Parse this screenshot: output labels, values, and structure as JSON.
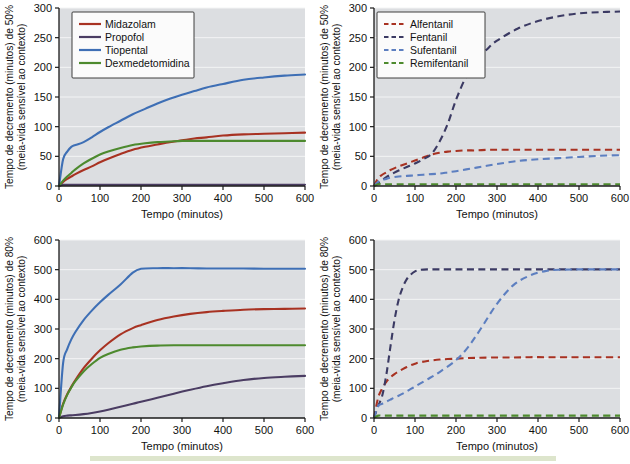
{
  "figure": {
    "background_color": "#ffffff",
    "plot_background_color": "#dcdee1",
    "gridline_color": "#f3f4f5",
    "accent_bar_color": "#dde5cc"
  },
  "common": {
    "xlabel": "Tempo (minutos)",
    "ylabel_line2": "(meia-vida sensível ao contexto)",
    "x_ticks": [
      "0",
      "100",
      "200",
      "300",
      "400",
      "500",
      "600"
    ]
  },
  "chart_data": [
    {
      "id": "panel-top-left",
      "type": "line",
      "title": "",
      "xlabel": "Tempo (minutos)",
      "ylabel": "Tempo de decremento (minutos) de 50%",
      "ylabel_sub": "(meia-vida sensível ao contexto)",
      "xlim": [
        0,
        600
      ],
      "ylim": [
        0,
        300
      ],
      "x_ticks": [
        0,
        100,
        200,
        300,
        400,
        500,
        600
      ],
      "y_ticks": [
        0,
        50,
        100,
        150,
        200,
        250,
        300
      ],
      "grid": true,
      "legend_position": "top-left",
      "line_style": "solid",
      "x": [
        0,
        10,
        20,
        30,
        40,
        60,
        80,
        100,
        120,
        150,
        180,
        210,
        240,
        270,
        300,
        330,
        360,
        400,
        450,
        500,
        550,
        600
      ],
      "series": [
        {
          "name": "Midazolam",
          "color": "#a83222",
          "values": [
            0,
            7,
            12,
            16,
            20,
            27,
            33,
            40,
            46,
            54,
            61,
            66,
            70,
            74,
            77,
            80,
            82,
            85,
            87,
            88,
            89,
            90
          ]
        },
        {
          "name": "Propofol",
          "color": "#4b3d63",
          "values": [
            0,
            2,
            2,
            2,
            2,
            2,
            2,
            2,
            2,
            2,
            2,
            2,
            2,
            2,
            2,
            2,
            2,
            2,
            2,
            2,
            2,
            2
          ]
        },
        {
          "name": "Tiopental",
          "color": "#3e6fb5",
          "values": [
            0,
            45,
            58,
            66,
            69,
            74,
            82,
            91,
            99,
            110,
            121,
            130,
            139,
            147,
            154,
            160,
            166,
            172,
            179,
            183,
            186,
            188
          ]
        },
        {
          "name": "Dexmedetomidina",
          "color": "#4d8a2e",
          "values": [
            0,
            9,
            16,
            22,
            28,
            38,
            46,
            53,
            58,
            64,
            69,
            72,
            74,
            75,
            76,
            76,
            76,
            76,
            76,
            76,
            76,
            76
          ]
        }
      ]
    },
    {
      "id": "panel-top-right",
      "type": "line",
      "title": "",
      "xlabel": "Tempo (minutos)",
      "ylabel": "Tempo de decremento (minutos) de 50%",
      "ylabel_sub": "(meia-vida sensível ao contexto)",
      "xlim": [
        0,
        600
      ],
      "ylim": [
        0,
        300
      ],
      "x_ticks": [
        0,
        100,
        200,
        300,
        400,
        500,
        600
      ],
      "y_ticks": [
        0,
        50,
        100,
        150,
        200,
        250,
        300
      ],
      "grid": true,
      "legend_position": "top-left",
      "line_style": "dashed",
      "x": [
        0,
        10,
        20,
        30,
        40,
        60,
        80,
        100,
        120,
        140,
        160,
        180,
        200,
        225,
        250,
        275,
        300,
        350,
        400,
        450,
        500,
        550,
        600
      ],
      "series": [
        {
          "name": "Alfentanil",
          "color": "#a83222",
          "values": [
            0,
            13,
            19,
            23,
            27,
            33,
            38,
            43,
            48,
            53,
            56,
            58,
            59,
            60,
            60,
            61,
            61,
            61,
            61,
            61,
            61,
            61,
            61
          ]
        },
        {
          "name": "Fentanil",
          "color": "#3b3a63",
          "values": [
            0,
            5,
            10,
            15,
            19,
            26,
            32,
            38,
            45,
            54,
            75,
            105,
            145,
            185,
            212,
            230,
            245,
            265,
            278,
            286,
            291,
            293,
            294
          ]
        },
        {
          "name": "Sufentanil",
          "color": "#5d7fc0",
          "values": [
            0,
            7,
            10,
            12,
            14,
            16,
            17,
            18,
            19,
            20,
            21,
            23,
            25,
            28,
            31,
            34,
            37,
            42,
            45,
            47,
            49,
            51,
            52
          ]
        },
        {
          "name": "Remifentanil",
          "color": "#4d8a2e",
          "values": [
            0,
            3,
            3,
            3,
            3,
            3,
            3,
            3,
            3,
            3,
            3,
            3,
            3,
            3,
            3,
            3,
            3,
            3,
            3,
            3,
            3,
            3,
            3
          ]
        }
      ]
    },
    {
      "id": "panel-bottom-left",
      "type": "line",
      "title": "",
      "xlabel": "Tempo (minutos)",
      "ylabel": "Tempo de decremento (minutos) de 80%",
      "ylabel_sub": "(meia-vida sensível ao contexto)",
      "xlim": [
        0,
        600
      ],
      "ylim": [
        0,
        600
      ],
      "x_ticks": [
        0,
        100,
        200,
        300,
        400,
        500,
        600
      ],
      "y_ticks": [
        0,
        100,
        200,
        300,
        400,
        500,
        600
      ],
      "grid": true,
      "legend_position": "none",
      "line_style": "solid",
      "x": [
        0,
        10,
        20,
        30,
        40,
        60,
        80,
        100,
        120,
        150,
        180,
        200,
        240,
        280,
        320,
        360,
        400,
        450,
        500,
        550,
        600
      ],
      "series": [
        {
          "name": "Midazolam",
          "color": "#a83222",
          "values": [
            0,
            48,
            80,
            105,
            128,
            168,
            200,
            228,
            252,
            282,
            303,
            313,
            330,
            342,
            351,
            357,
            361,
            365,
            367,
            368,
            369
          ]
        },
        {
          "name": "Propofol",
          "color": "#4b3d63",
          "values": [
            0,
            6,
            8,
            9,
            10,
            13,
            17,
            22,
            28,
            38,
            48,
            55,
            68,
            82,
            95,
            107,
            117,
            128,
            135,
            139,
            142
          ]
        },
        {
          "name": "Tiopental",
          "color": "#3e6fb5",
          "values": [
            0,
            185,
            232,
            265,
            290,
            330,
            362,
            390,
            415,
            450,
            490,
            503,
            505,
            505,
            505,
            504,
            504,
            504,
            503,
            503,
            503
          ]
        },
        {
          "name": "Dexmedetomidina",
          "color": "#4d8a2e",
          "values": [
            0,
            45,
            78,
            103,
            124,
            157,
            182,
            203,
            216,
            230,
            238,
            241,
            244,
            245,
            245,
            245,
            245,
            245,
            245,
            245,
            245
          ]
        }
      ]
    },
    {
      "id": "panel-bottom-right",
      "type": "line",
      "title": "",
      "xlabel": "Tempo (minutos)",
      "ylabel": "Tempo de decremento (minutos) de 80%",
      "ylabel_sub": "(meia-vida sensível ao contexto)",
      "xlim": [
        0,
        600
      ],
      "ylim": [
        0,
        600
      ],
      "x_ticks": [
        0,
        100,
        200,
        300,
        400,
        500,
        600
      ],
      "y_ticks": [
        0,
        100,
        200,
        300,
        400,
        500,
        600
      ],
      "grid": true,
      "legend_position": "none",
      "line_style": "dashed",
      "x": [
        0,
        10,
        20,
        30,
        40,
        50,
        60,
        70,
        80,
        90,
        100,
        110,
        130,
        160,
        200,
        230,
        260,
        300,
        340,
        380,
        420,
        460,
        500,
        550,
        600
      ],
      "series": [
        {
          "name": "Alfentanil",
          "color": "#a83222",
          "values": [
            0,
            68,
            100,
            122,
            137,
            148,
            157,
            165,
            172,
            178,
            183,
            187,
            192,
            197,
            200,
            202,
            203,
            204,
            204,
            205,
            205,
            205,
            205,
            205,
            205
          ]
        },
        {
          "name": "Fentanil",
          "color": "#3b3a63",
          "values": [
            0,
            40,
            75,
            145,
            240,
            330,
            398,
            440,
            468,
            484,
            494,
            499,
            501,
            501,
            501,
            501,
            501,
            501,
            501,
            501,
            501,
            501,
            501,
            501,
            501
          ]
        },
        {
          "name": "Sufentanil",
          "color": "#5d7fc0",
          "values": [
            0,
            40,
            48,
            55,
            62,
            69,
            75,
            82,
            90,
            98,
            106,
            114,
            130,
            155,
            195,
            240,
            300,
            385,
            448,
            480,
            496,
            500,
            501,
            501,
            501
          ]
        },
        {
          "name": "Remifentanil",
          "color": "#4d8a2e",
          "values": [
            0,
            8,
            8,
            8,
            8,
            8,
            8,
            8,
            8,
            8,
            8,
            8,
            8,
            8,
            8,
            8,
            8,
            8,
            8,
            8,
            8,
            8,
            8,
            8,
            8
          ]
        }
      ]
    }
  ]
}
